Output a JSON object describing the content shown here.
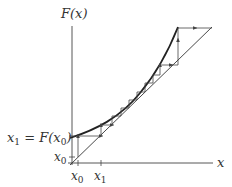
{
  "diagram": {
    "y_axis_label": "F(x)",
    "x_axis_label": "x",
    "left_labels": {
      "x1_eq": {
        "main": "x",
        "sub": "1",
        "rest": " = F(x",
        "sub2": "0",
        "end": ")"
      },
      "x0": {
        "main": "x",
        "sub": "0"
      }
    },
    "bottom_ticks": [
      {
        "main": "x",
        "sub": "0"
      },
      {
        "main": "x",
        "sub": "1"
      }
    ],
    "colors": {
      "ink": "#333333",
      "curve": "#222222",
      "background": "#ffffff"
    }
  }
}
